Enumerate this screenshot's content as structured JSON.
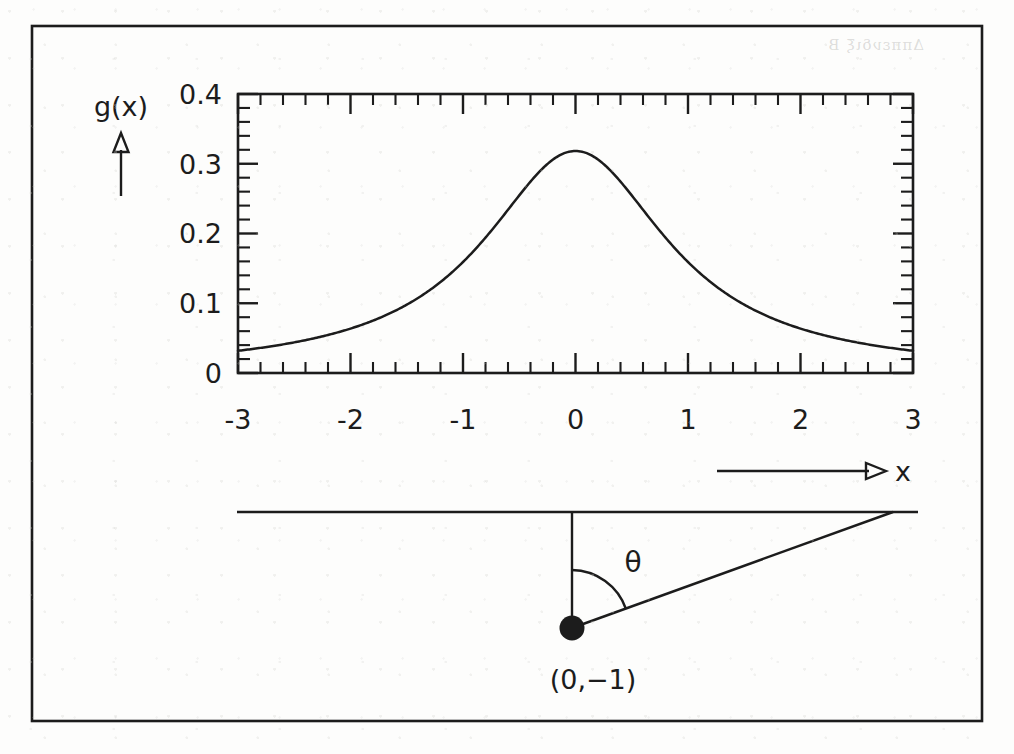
{
  "figure": {
    "kind": "scanned-textbook-figure",
    "ink_color": "#1c1c1c",
    "paper_color": "#fdfdfc",
    "border": {
      "x": 32,
      "y": 26,
      "width": 950,
      "height": 695
    }
  },
  "chart_data": {
    "type": "line",
    "title": "",
    "subtitle": "",
    "xlabel": "x",
    "ylabel": "g(x)",
    "xlim": [
      -3,
      3
    ],
    "ylim": [
      0,
      0.4
    ],
    "grid": false,
    "legend": null,
    "x_ticks": [
      -3,
      -2,
      -1,
      0,
      1,
      2,
      3
    ],
    "x_tick_labels": [
      "-3",
      "-2",
      "-1",
      "0",
      "1",
      "2",
      "3"
    ],
    "y_ticks": [
      0,
      0.1,
      0.2,
      0.3,
      0.4
    ],
    "y_tick_labels": [
      "0",
      "0.1",
      "0.2",
      "0.3",
      "0.4"
    ],
    "x_minor_per_major": 5,
    "y_minor_per_major": 5,
    "series": [
      {
        "name": "g(x) = 1/(pi(1+x^2))",
        "x": [
          -3.0,
          -2.8,
          -2.6,
          -2.4,
          -2.2,
          -2.0,
          -1.8,
          -1.6,
          -1.4,
          -1.2,
          -1.0,
          -0.8,
          -0.6,
          -0.4,
          -0.2,
          0.0,
          0.2,
          0.4,
          0.6,
          0.8,
          1.0,
          1.2,
          1.4,
          1.6,
          1.8,
          2.0,
          2.2,
          2.4,
          2.6,
          2.8,
          3.0
        ],
        "values": [
          0.0318,
          0.0361,
          0.0412,
          0.0472,
          0.0545,
          0.0637,
          0.0752,
          0.0894,
          0.1076,
          0.1304,
          0.1592,
          0.194,
          0.2341,
          0.2744,
          0.306,
          0.3183,
          0.306,
          0.2744,
          0.2341,
          0.194,
          0.1592,
          0.1304,
          0.1076,
          0.0894,
          0.0752,
          0.0637,
          0.0545,
          0.0472,
          0.0412,
          0.0361,
          0.0318
        ]
      }
    ],
    "peak": {
      "x": 0,
      "y": 0.3183
    },
    "annotations": [
      {
        "name": "y-axis-label",
        "text": "g(x)"
      },
      {
        "name": "x-axis-label",
        "text": "x"
      }
    ]
  },
  "diagram": {
    "name": "angle-geometry-diagram",
    "point_label": "(0,−1)",
    "angle_label": "θ",
    "elements": [
      "horizontal-line",
      "vertical-segment",
      "slanted-ray",
      "angle-arc",
      "point-marker"
    ]
  },
  "axis_arrows": {
    "y_arrow_label": "g(x)",
    "x_arrow_label": "x"
  },
  "bleed_through": {
    "text": "Δππενδιξ B"
  }
}
